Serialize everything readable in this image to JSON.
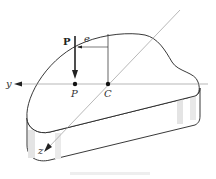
{
  "figure": {
    "labels": {
      "load": "P",
      "point_p": "P",
      "centroid": "C",
      "eccentricity": "e",
      "y_axis": "y",
      "z_axis": "z"
    },
    "colors": {
      "stroke": "#222222",
      "axis": "#999999",
      "shade": "#e4e4e4"
    }
  }
}
